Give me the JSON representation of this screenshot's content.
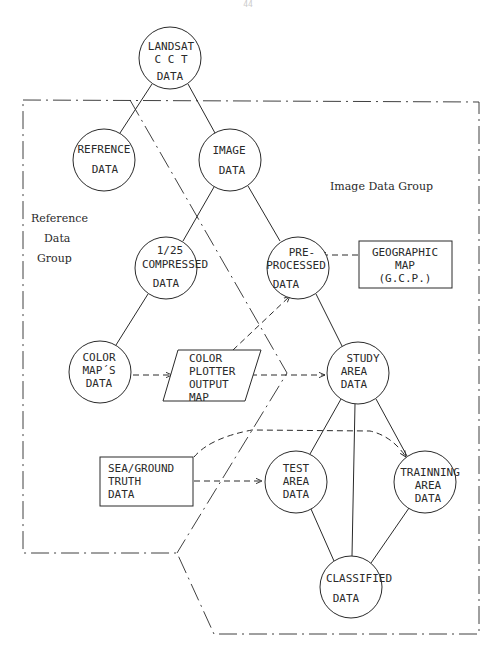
{
  "page_number": "44",
  "colors": {
    "ink": "#2a2a2a",
    "background": "#ffffff"
  },
  "nodes": {
    "landsat": {
      "lines": [
        "LANDSAT",
        "C C T",
        "DATA"
      ]
    },
    "reference": {
      "lines": [
        "REFRENCE",
        "DATA"
      ]
    },
    "image": {
      "lines": [
        "IMAGE",
        "DATA"
      ]
    },
    "compressed": {
      "lines": [
        "1/25",
        "COMPRESSED",
        "DATA"
      ]
    },
    "preprocessed": {
      "lines": [
        "PRE-",
        "PROCESSED",
        "DATA"
      ]
    },
    "geographic_map": {
      "lines": [
        "GEOGRAPHIC",
        "MAP",
        "(G.C.P.)"
      ]
    },
    "color_maps": {
      "lines": [
        "COLOR",
        "MAP´S",
        "DATA"
      ]
    },
    "color_plotter": {
      "lines": [
        "COLOR",
        "PLOTTER",
        "OUTPUT",
        "MAP"
      ]
    },
    "study_area": {
      "lines": [
        "STUDY",
        "AREA",
        "DATA"
      ]
    },
    "sea_ground": {
      "lines": [
        "SEA/GROUND",
        "TRUTH",
        "DATA"
      ]
    },
    "test_area": {
      "lines": [
        "TEST",
        "AREA",
        "DATA"
      ]
    },
    "training_area": {
      "lines": [
        "TRAINNING",
        "AREA",
        "DATA"
      ]
    },
    "classified": {
      "lines": [
        "CLASSIFIED",
        "DATA"
      ]
    }
  },
  "groups": {
    "image_data_group": "Image Data Group",
    "reference_data_group": {
      "lines": [
        "Reference",
        "Data",
        "Group"
      ]
    }
  },
  "edges": [
    {
      "from": "landsat",
      "to": "reference",
      "style": "solid"
    },
    {
      "from": "landsat",
      "to": "image",
      "style": "solid"
    },
    {
      "from": "image",
      "to": "compressed",
      "style": "solid"
    },
    {
      "from": "image",
      "to": "preprocessed",
      "style": "solid"
    },
    {
      "from": "compressed",
      "to": "color_maps",
      "style": "solid"
    },
    {
      "from": "preprocessed",
      "to": "study_area",
      "style": "solid"
    },
    {
      "from": "geographic_map",
      "to": "preprocessed",
      "style": "dashed-arrow"
    },
    {
      "from": "color_maps",
      "to": "color_plotter",
      "style": "dashed-arrow"
    },
    {
      "from": "color_plotter",
      "to": "preprocessed",
      "style": "dashed-arrow"
    },
    {
      "from": "color_plotter",
      "to": "study_area",
      "style": "dashed-arrow"
    },
    {
      "from": "study_area",
      "to": "test_area",
      "style": "solid"
    },
    {
      "from": "study_area",
      "to": "training_area",
      "style": "solid"
    },
    {
      "from": "study_area",
      "to": "classified",
      "style": "solid"
    },
    {
      "from": "test_area",
      "to": "classified",
      "style": "solid"
    },
    {
      "from": "training_area",
      "to": "classified",
      "style": "solid"
    },
    {
      "from": "sea_ground",
      "to": "test_area",
      "style": "dashed-arrow"
    },
    {
      "from": "sea_ground",
      "to": "training_area",
      "style": "dashed-arrow"
    }
  ]
}
